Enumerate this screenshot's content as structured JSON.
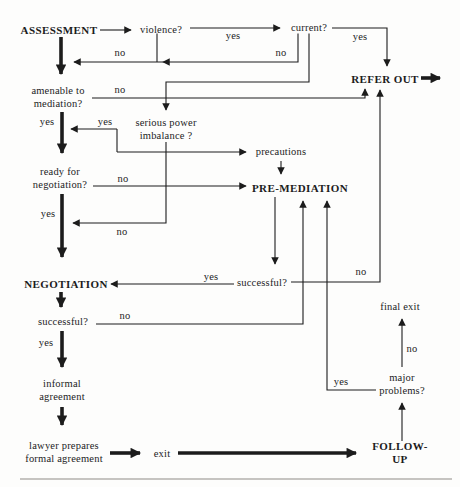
{
  "colors": {
    "ink": "#1c1c1c",
    "background": "#fdfdfc",
    "divider": "#b3b1ae"
  },
  "nodes": {
    "assessment": "ASSESSMENT",
    "violence": "violence?",
    "current": "current?",
    "refer_out": "REFER OUT",
    "amenable": "amenable to\nmediation?",
    "imbalance": "serious power\nimbalance ?",
    "precautions": "precautions",
    "ready": "ready for\nnegotiation?",
    "pre_mediation": "PRE-MEDIATION",
    "negotiation": "NEGOTIATION",
    "pm_successful": "successful?",
    "neg_successful": "successful?",
    "final_exit": "final exit",
    "informal": "informal\nagreement",
    "major_problems": "major\nproblems?",
    "lawyer": "lawyer prepares\nformal agreement",
    "exit": "exit",
    "follow_up": "FOLLOW-UP"
  },
  "edge_labels": {
    "violence_yes": "yes",
    "violence_no": "no",
    "current_yes": "yes",
    "current_no": "no",
    "amenable_no": "no",
    "amenable_yes": "yes",
    "imbalance_yes": "yes",
    "imbalance_no": "no",
    "ready_no": "no",
    "ready_yes": "yes",
    "pm_successful_yes": "yes",
    "pm_successful_no": "no",
    "neg_successful_no": "no",
    "neg_successful_yes": "yes",
    "major_problems_yes": "yes",
    "major_problems_no": "no"
  }
}
